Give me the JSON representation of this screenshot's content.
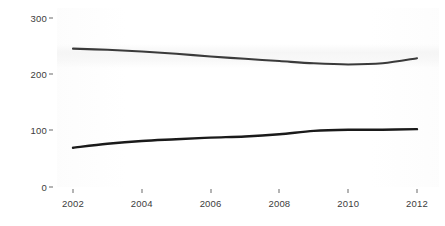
{
  "chart_data": {
    "type": "line",
    "title": "",
    "subtitle": "",
    "xlabel": "",
    "ylabel": "",
    "xlim": [
      2002,
      2012
    ],
    "ylim": [
      0,
      300
    ],
    "grid": false,
    "legend": false,
    "legend_position": "none",
    "x_ticks": [
      "2002",
      "2004",
      "2006",
      "2008",
      "2010",
      "2012"
    ],
    "x_tick_values": [
      2002,
      2004,
      2006,
      2008,
      2010,
      2012
    ],
    "y_ticks": [
      "0",
      "100",
      "200",
      "300"
    ],
    "y_tick_values": [
      0,
      100,
      200,
      300
    ],
    "x": [
      2002,
      2003,
      2004,
      2005,
      2006,
      2007,
      2008,
      2009,
      2010,
      2011,
      2012
    ],
    "series": [
      {
        "name": "upper-series",
        "color": "#3a3a3a",
        "values": [
          245,
          243,
          240,
          236,
          231,
          227,
          223,
          219,
          217,
          219,
          228
        ]
      },
      {
        "name": "lower-series",
        "color": "#1a1a1a",
        "values": [
          69,
          76,
          81,
          84,
          87,
          89,
          93,
          99,
          101,
          101,
          102
        ]
      }
    ],
    "annotations": []
  },
  "axes": {
    "y_tick_labels": [
      "300",
      "200",
      "100",
      "0"
    ],
    "x_tick_labels": [
      "2002",
      "2004",
      "2006",
      "2008",
      "2010",
      "2012"
    ]
  },
  "style": {
    "line_color_upper": "#3a3a3a",
    "line_color_lower": "#1a1a1a",
    "axis_text_color": "#3c3c3c",
    "background": "#ffffff"
  }
}
